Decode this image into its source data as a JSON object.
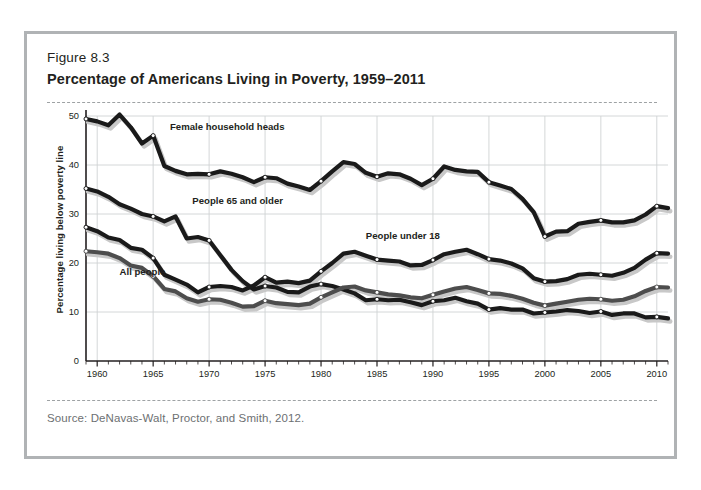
{
  "figure": {
    "number": "Figure 8.3",
    "title": "Percentage of Americans Living in Poverty, 1959–2011",
    "source": "Source: DeNavas-Walt, Proctor, and Smith, 2012."
  },
  "colors": {
    "frame_border": "#b0b3b5",
    "dashed_rule": "#9ea2a4",
    "text": "#231f20",
    "source_text": "#6d7072",
    "grid": "#cfd2d4",
    "axis": "#231f20",
    "series_dark": "#1a1a1a",
    "series_gray": "#4d4d4d",
    "marker_fill": "#ffffff",
    "shadow": "#c8c8c8"
  },
  "chart_data": {
    "type": "line",
    "title": "Percentage of Americans Living in Poverty, 1959–2011",
    "xlabel": "",
    "ylabel": "Percentage living below poverty line",
    "xlim": [
      1959,
      2011
    ],
    "ylim": [
      0,
      50
    ],
    "yticks": [
      0,
      10,
      20,
      30,
      40,
      50
    ],
    "xticks": [
      1960,
      1965,
      1970,
      1975,
      1980,
      1985,
      1990,
      1995,
      2000,
      2005,
      2010
    ],
    "minor_xtick_interval": 1,
    "grid": true,
    "legend": "inline-labels",
    "x": [
      1959,
      1960,
      1961,
      1962,
      1963,
      1964,
      1965,
      1966,
      1967,
      1968,
      1969,
      1970,
      1971,
      1972,
      1973,
      1974,
      1975,
      1976,
      1977,
      1978,
      1979,
      1980,
      1981,
      1982,
      1983,
      1984,
      1985,
      1986,
      1987,
      1988,
      1989,
      1990,
      1991,
      1992,
      1993,
      1994,
      1995,
      1996,
      1997,
      1998,
      1999,
      2000,
      2001,
      2002,
      2003,
      2004,
      2005,
      2006,
      2007,
      2008,
      2009,
      2010,
      2011
    ],
    "series": [
      {
        "name": "Female household heads",
        "label": "Female household heads",
        "color": "#1a1a1a",
        "values": [
          49.4,
          48.9,
          48.1,
          50.3,
          47.7,
          44.4,
          46.0,
          39.8,
          38.8,
          38.1,
          38.2,
          38.1,
          38.7,
          38.2,
          37.5,
          36.5,
          37.5,
          37.3,
          36.2,
          35.6,
          34.9,
          36.7,
          38.7,
          40.6,
          40.2,
          38.4,
          37.6,
          38.3,
          38.1,
          37.2,
          35.9,
          37.2,
          39.7,
          39.0,
          38.7,
          38.6,
          36.5,
          35.8,
          35.1,
          33.1,
          30.4,
          25.4,
          26.4,
          26.5,
          28.0,
          28.4,
          28.7,
          28.3,
          28.3,
          28.7,
          29.9,
          31.6,
          31.2
        ]
      },
      {
        "name": "People 65 and older",
        "label": "People 65 and older",
        "color": "#1a1a1a",
        "values": [
          35.2,
          34.6,
          33.5,
          32.0,
          31.1,
          30.0,
          29.5,
          28.5,
          29.5,
          25.0,
          25.3,
          24.6,
          21.6,
          18.6,
          16.3,
          14.6,
          15.3,
          15.0,
          14.1,
          14.0,
          15.2,
          15.7,
          15.3,
          14.6,
          13.8,
          12.4,
          12.6,
          12.4,
          12.5,
          12.0,
          11.4,
          12.2,
          12.4,
          12.9,
          12.2,
          11.7,
          10.5,
          10.8,
          10.5,
          10.5,
          9.7,
          9.9,
          10.1,
          10.4,
          10.2,
          9.8,
          10.1,
          9.4,
          9.7,
          9.7,
          8.9,
          9.0,
          8.7
        ]
      },
      {
        "name": "People under 18",
        "label": "People under 18",
        "color": "#1a1a1a",
        "values": [
          27.3,
          26.5,
          25.2,
          24.7,
          23.1,
          22.7,
          21.0,
          17.6,
          16.6,
          15.6,
          14.0,
          15.1,
          15.3,
          15.1,
          14.4,
          15.4,
          17.1,
          16.0,
          16.2,
          15.9,
          16.4,
          18.3,
          20.0,
          21.9,
          22.3,
          21.5,
          20.7,
          20.5,
          20.3,
          19.5,
          19.6,
          20.6,
          21.8,
          22.3,
          22.7,
          21.8,
          20.8,
          20.5,
          19.9,
          18.9,
          16.9,
          16.2,
          16.3,
          16.7,
          17.6,
          17.8,
          17.6,
          17.4,
          18.0,
          19.0,
          20.7,
          22.0,
          21.9
        ]
      },
      {
        "name": "All people",
        "label": "All people",
        "color": "#4d4d4d",
        "values": [
          22.4,
          22.2,
          21.9,
          21.0,
          19.5,
          19.0,
          17.3,
          14.7,
          14.2,
          12.8,
          12.1,
          12.6,
          12.5,
          11.9,
          11.1,
          11.2,
          12.3,
          11.8,
          11.6,
          11.4,
          11.7,
          13.0,
          14.0,
          15.0,
          15.2,
          14.4,
          14.0,
          13.6,
          13.4,
          13.0,
          12.8,
          13.5,
          14.2,
          14.8,
          15.1,
          14.5,
          13.8,
          13.7,
          13.3,
          12.7,
          11.9,
          11.3,
          11.7,
          12.1,
          12.5,
          12.7,
          12.6,
          12.3,
          12.5,
          13.2,
          14.3,
          15.1,
          15.0
        ]
      }
    ],
    "marker_years": [
      1959,
      1965,
      1970,
      1975,
      1980,
      1985,
      1990,
      1995,
      2000,
      2005,
      2010
    ],
    "label_positions": [
      {
        "series": "Female household heads",
        "x": 1966.5,
        "y": 47.2
      },
      {
        "series": "People 65 and older",
        "x": 1968.5,
        "y": 32.0
      },
      {
        "series": "People under 18",
        "x": 1984.0,
        "y": 24.8
      },
      {
        "series": "All people",
        "x": 1962.0,
        "y": 17.6
      }
    ]
  }
}
